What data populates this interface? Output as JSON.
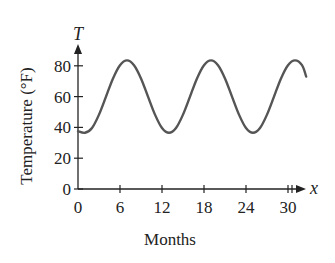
{
  "chart_data": {
    "type": "line",
    "title": "",
    "xlabel": "Months",
    "ylabel": "Temperature (°F)",
    "x_axis_letter": "x",
    "y_axis_letter": "T",
    "xlim": [
      0,
      32.6
    ],
    "ylim": [
      0,
      90
    ],
    "xticks": [
      0,
      6,
      12,
      18,
      24,
      30
    ],
    "xtick_labels": [
      "0",
      "6",
      "12",
      "18",
      "24",
      "30"
    ],
    "yticks": [
      0,
      20,
      40,
      60,
      80
    ],
    "ytick_labels": [
      "0",
      "20",
      "40",
      "60",
      "80"
    ],
    "grid": false,
    "legend": null,
    "series": [
      {
        "name": "Temperature",
        "x": [
          0,
          1,
          2,
          3,
          4,
          5,
          6,
          7,
          8,
          9,
          10,
          11,
          12,
          13,
          14,
          15,
          16,
          17,
          18,
          19,
          20,
          21,
          22,
          23,
          24,
          25,
          26,
          27,
          28,
          29,
          30,
          31,
          32,
          32.6
        ],
        "values": [
          37.5,
          36.5,
          39.6,
          48.3,
          60.0,
          71.8,
          80.4,
          83.5,
          80.4,
          71.8,
          60.0,
          48.3,
          39.6,
          36.5,
          39.6,
          48.3,
          60.0,
          71.8,
          80.4,
          83.5,
          80.4,
          71.8,
          60.0,
          48.3,
          39.6,
          36.5,
          39.6,
          48.3,
          60.0,
          71.8,
          80.4,
          83.5,
          80.4,
          73.0
        ]
      }
    ]
  }
}
